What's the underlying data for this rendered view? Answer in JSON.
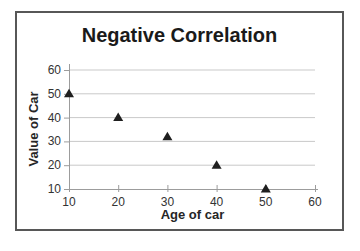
{
  "chart_data": {
    "type": "scatter",
    "title": "Negative Correlation",
    "xlabel": "Age of car",
    "ylabel": "Value of Car",
    "x": [
      10,
      20,
      30,
      40,
      50
    ],
    "y": [
      50,
      40,
      32,
      20,
      10
    ],
    "xlim": [
      10,
      60
    ],
    "ylim": [
      10,
      60
    ],
    "x_ticks": [
      10,
      20,
      30,
      40,
      50,
      60
    ],
    "y_ticks": [
      10,
      20,
      30,
      40,
      50,
      60
    ],
    "marker": "triangle",
    "grid": "horizontal",
    "legend": "none",
    "colors": {
      "marker": "#1f1f1f",
      "gridline": "#c9c9c9",
      "axis": "#9c9c9c",
      "tick_text": "#333333",
      "title_text": "#1a1a1a",
      "frame_border": "#575757",
      "background": "#ffffff"
    }
  }
}
